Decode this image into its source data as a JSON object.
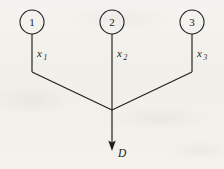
{
  "figure": {
    "kind": "signal-flow-diagram",
    "background_color": "#f3f1ec",
    "ink_color": "#1f1f1f",
    "nodes": [
      {
        "id": "node-1",
        "label": "1",
        "cx": 32,
        "cy": 22,
        "r": 12
      },
      {
        "id": "node-2",
        "label": "2",
        "cx": 112,
        "cy": 22,
        "r": 12
      },
      {
        "id": "node-3",
        "label": "3",
        "cx": 192,
        "cy": 22,
        "r": 12
      }
    ],
    "branch_labels": [
      {
        "id": "label-x1",
        "base": "x",
        "sub": "1",
        "x": 37,
        "y": 57
      },
      {
        "id": "label-x2",
        "base": "x",
        "sub": "2",
        "x": 117,
        "y": 57
      },
      {
        "id": "label-x3",
        "base": "x",
        "sub": "3",
        "x": 197,
        "y": 57
      }
    ],
    "junction": {
      "x": 112,
      "y": 110
    },
    "output": {
      "label": "D",
      "label_x": 118,
      "label_y": 157,
      "arrow_from_y": 110,
      "arrow_tip_y": 150
    }
  }
}
